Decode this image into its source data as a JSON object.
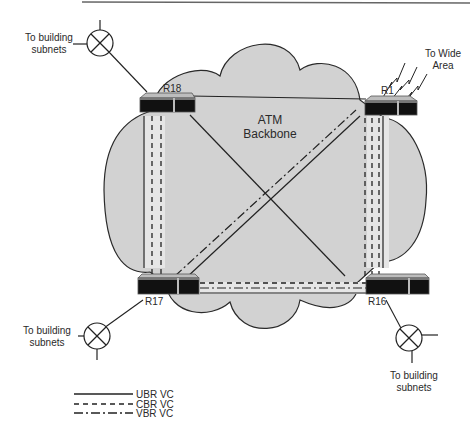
{
  "diagram": {
    "title_rule": true,
    "backbone": {
      "label_line1": "ATM",
      "label_line2": "Backbone",
      "fill": "#d2d2d2",
      "stroke": "#333333"
    },
    "routers": [
      {
        "id": "R18",
        "label": "R18",
        "x": 138,
        "y": 97
      },
      {
        "id": "R1",
        "label": "R1",
        "x": 366,
        "y": 99
      },
      {
        "id": "R17",
        "label": "R17",
        "x": 138,
        "y": 276
      },
      {
        "id": "R16",
        "label": "R16",
        "x": 366,
        "y": 276
      }
    ],
    "subnets": [
      {
        "id": "subnet-top-left",
        "line1": "To building",
        "line2": "subnets",
        "cx": 100,
        "cy": 43
      },
      {
        "id": "subnet-bottom-left",
        "line1": "To building",
        "line2": "subnets",
        "cx": 97,
        "cy": 336
      },
      {
        "id": "subnet-bottom-right",
        "line1": "To building",
        "line2": "subnets",
        "cx": 409,
        "cy": 338
      }
    ],
    "wide_area": {
      "line1": "To Wide",
      "line2": "Area"
    },
    "connections": [
      {
        "from": "R18",
        "to": "R1",
        "type": "UBR"
      },
      {
        "from": "R18",
        "to": "R16",
        "type": "UBR"
      },
      {
        "from": "R17",
        "to": "R1",
        "type": "UBR"
      },
      {
        "from": "R17",
        "to": "R1",
        "type": "VBR"
      },
      {
        "from": "R18",
        "to": "R17",
        "type": "UBR"
      },
      {
        "from": "R18",
        "to": "R17",
        "type": "CBR"
      },
      {
        "from": "R18",
        "to": "R17",
        "type": "CBR"
      },
      {
        "from": "R1",
        "to": "R16",
        "type": "UBR"
      },
      {
        "from": "R1",
        "to": "R16",
        "type": "CBR"
      },
      {
        "from": "R1",
        "to": "R16",
        "type": "CBR"
      },
      {
        "from": "R1",
        "to": "R16",
        "type": "CBR"
      },
      {
        "from": "R17",
        "to": "R16",
        "type": "UBR"
      },
      {
        "from": "R17",
        "to": "R16",
        "type": "CBR"
      },
      {
        "from": "R17",
        "to": "R16",
        "type": "VBR"
      }
    ]
  },
  "legend": {
    "items": [
      {
        "label": "UBR VC",
        "style": "solid"
      },
      {
        "label": "CBR VC",
        "style": "dashed"
      },
      {
        "label": "VBR VC",
        "style": "dash-dot"
      }
    ]
  }
}
